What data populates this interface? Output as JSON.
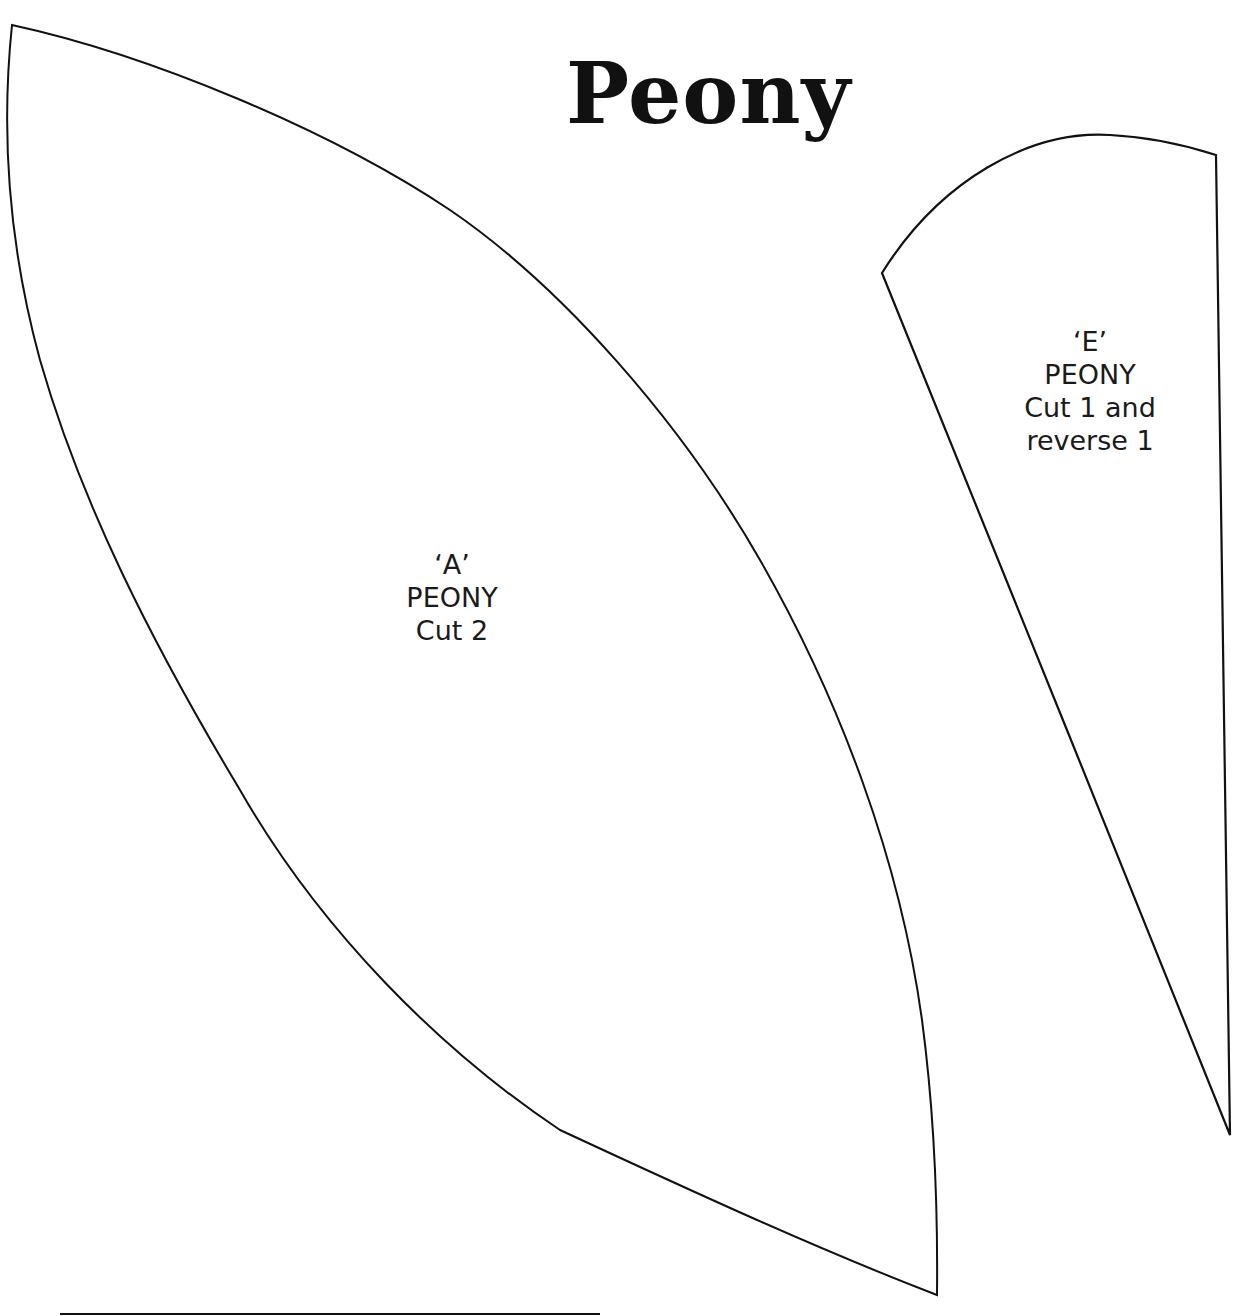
{
  "page": {
    "title": "Peony"
  },
  "pieces": [
    {
      "id": "A",
      "lines": [
        "‘A’",
        "PEONY",
        "Cut 2"
      ]
    },
    {
      "id": "E",
      "lines": [
        "‘E’",
        "PEONY",
        "Cut 1 and",
        "reverse 1"
      ]
    }
  ],
  "colors": {
    "outline": "#111111",
    "background": "#ffffff",
    "text": "#1a1a1a"
  }
}
